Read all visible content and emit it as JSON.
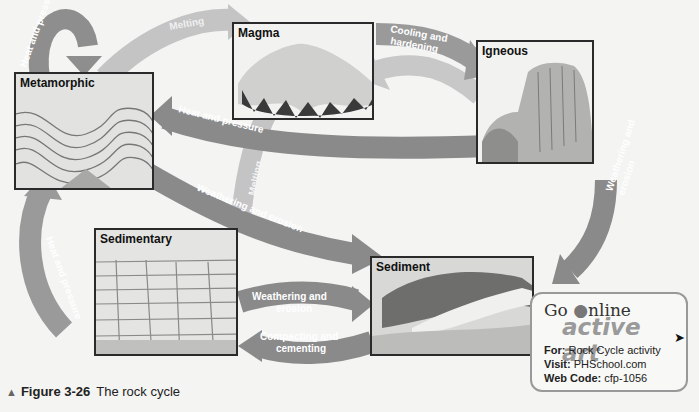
{
  "figure": {
    "number": "Figure 3-26",
    "caption": "The rock cycle"
  },
  "nodes": {
    "metamorphic": "Metamorphic",
    "magma": "Magma",
    "igneous": "Igneous",
    "sedimentary": "Sedimentary",
    "sediment": "Sediment"
  },
  "arrows": {
    "meta_self": "Heat and pressure",
    "meta_to_magma": "Melting",
    "magma_to_igneous_1": "Cooling and",
    "magma_to_igneous_2": "hardening",
    "igneous_to_magma": "Melting",
    "igneous_to_meta": "Heat and pressure",
    "sedimentary_to_magma": "Melting",
    "meta_to_sediment": "Weathering and erosion",
    "sed_to_meta": "Heat and pressure",
    "igneous_to_sediment_1": "Weathering and",
    "igneous_to_sediment_2": "erosion",
    "sedimentary_to_sediment_1": "Weathering and",
    "sedimentary_to_sediment_2": "erosion",
    "sediment_to_sedimentary_1": "Compacting and",
    "sediment_to_sedimentary_2": "cementing"
  },
  "go_online": {
    "go": "Go ",
    "online": "nline",
    "brand": "active art",
    "for_label": "For:",
    "for_value": " Rock Cycle activity",
    "visit_label": "Visit:",
    "visit_value": " PHSchool.com",
    "code_label": "Web Code:",
    "code_value": " cfp-1056"
  },
  "colors": {
    "arrow_dark": "#8a8a8a",
    "arrow_light": "#bdbdbd",
    "panel_border": "#2a2a2a",
    "background": "#f4f4f2"
  }
}
